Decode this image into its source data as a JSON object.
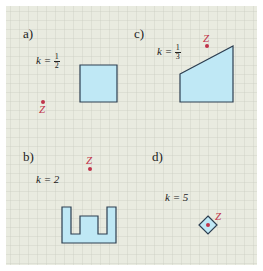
{
  "colors": {
    "paper": "#e9ebe0",
    "grid": "#c6c9bd",
    "shape_fill": "#bfe8f5",
    "shape_stroke": "#2c3e50",
    "center_point": "#c0334a"
  },
  "grid": {
    "cell_px": 9
  },
  "panels": [
    {
      "id": "a",
      "label": "a)",
      "k_prefix": "k = ",
      "k_num": "1",
      "k_den": "2",
      "center_label": "Z",
      "shape": "square",
      "points": [
        [
          80,
          65
        ],
        [
          117,
          65
        ],
        [
          117,
          102
        ],
        [
          80,
          102
        ]
      ]
    },
    {
      "id": "b",
      "label": "b)",
      "k_text": "k = 2",
      "center_label": "Z",
      "shape": "u-shape",
      "points": [
        [
          62,
          207
        ],
        [
          71,
          207
        ],
        [
          71,
          234
        ],
        [
          80,
          234
        ],
        [
          80,
          216
        ],
        [
          98,
          216
        ],
        [
          98,
          234
        ],
        [
          107,
          234
        ],
        [
          107,
          207
        ],
        [
          116,
          207
        ],
        [
          116,
          243
        ],
        [
          62,
          243
        ]
      ]
    },
    {
      "id": "c",
      "label": "c)",
      "k_prefix": "k = ",
      "k_num": "1",
      "k_den": "3",
      "center_label": "Z",
      "shape": "trapezoid",
      "points": [
        [
          180,
          74
        ],
        [
          233,
          46
        ],
        [
          233,
          102
        ],
        [
          180,
          102
        ]
      ]
    },
    {
      "id": "d",
      "label": "d)",
      "k_text": "k = 5",
      "center_label": "Z",
      "shape": "diamond",
      "points": [
        [
          208,
          216
        ],
        [
          217,
          225
        ],
        [
          208,
          234
        ],
        [
          199,
          225
        ]
      ]
    }
  ]
}
